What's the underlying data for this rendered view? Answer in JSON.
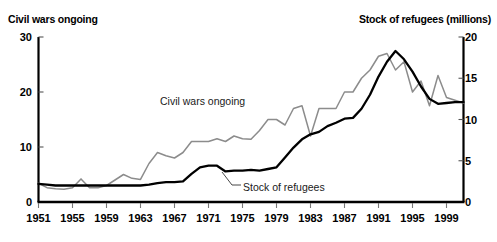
{
  "chart_data": {
    "type": "line",
    "title": "",
    "xlabel": "",
    "grid": false,
    "legend_position": "inline-annotations",
    "x": [
      1951,
      1952,
      1953,
      1954,
      1955,
      1956,
      1957,
      1958,
      1959,
      1960,
      1961,
      1962,
      1963,
      1964,
      1965,
      1966,
      1967,
      1968,
      1969,
      1970,
      1971,
      1972,
      1973,
      1974,
      1975,
      1976,
      1977,
      1978,
      1979,
      1980,
      1981,
      1982,
      1983,
      1984,
      1985,
      1986,
      1987,
      1988,
      1989,
      1990,
      1991,
      1992,
      1993,
      1994,
      1995,
      1996,
      1997,
      1998,
      1999,
      2000,
      2001
    ],
    "xticks": [
      1951,
      1955,
      1959,
      1963,
      1967,
      1971,
      1975,
      1979,
      1983,
      1987,
      1991,
      1995,
      1999
    ],
    "left_axis": {
      "label": "Civil wars ongoing",
      "ticks": [
        0,
        10,
        20,
        30
      ],
      "ylim": [
        0,
        30
      ]
    },
    "right_axis": {
      "label": "Stock of refugees (millions)",
      "ticks": [
        0,
        5,
        10,
        15,
        20
      ],
      "ylim": [
        0,
        20
      ]
    },
    "series": [
      {
        "name": "Civil wars ongoing",
        "axis": "left",
        "color": "#8c8c8c",
        "annotation": "Civil wars ongoing",
        "values": [
          3.4,
          2.6,
          2.4,
          2.3,
          2.6,
          4.2,
          2.6,
          2.6,
          3.0,
          4.0,
          5.0,
          4.3,
          4.1,
          7.0,
          9.0,
          8.4,
          8.0,
          9.0,
          11.0,
          11.0,
          11.0,
          11.5,
          11.0,
          12.0,
          11.5,
          11.4,
          13.0,
          15.0,
          15.0,
          14.0,
          17.0,
          17.5,
          12.0,
          17.0,
          17.0,
          17.0,
          20.0,
          20.0,
          22.5,
          24.0,
          26.5,
          27.0,
          24.0,
          25.5,
          20.0,
          22.0,
          17.5,
          23.0,
          19.0,
          18.5,
          18.0
        ]
      },
      {
        "name": "Stock of refugees",
        "axis": "right",
        "color": "#000000",
        "annotation": "Stock of refugees",
        "values": [
          2.2,
          2.1,
          2.0,
          2.0,
          2.0,
          2.0,
          2.0,
          2.0,
          2.0,
          2.0,
          2.0,
          2.0,
          2.0,
          2.1,
          2.3,
          2.4,
          2.4,
          2.5,
          3.4,
          4.2,
          4.4,
          4.4,
          3.7,
          3.8,
          3.8,
          3.9,
          3.8,
          4.0,
          4.2,
          5.4,
          6.6,
          7.6,
          8.2,
          8.5,
          9.2,
          9.6,
          10.1,
          10.2,
          11.3,
          13.0,
          15.2,
          17.0,
          18.3,
          17.3,
          15.8,
          14.0,
          12.5,
          11.9,
          12.0,
          12.1,
          12.1
        ]
      }
    ]
  }
}
